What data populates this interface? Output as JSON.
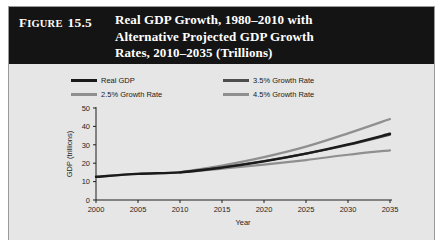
{
  "figure": {
    "tag_word": "Figure",
    "tag_number": "15.5",
    "title_lines": [
      "Real GDP Growth, 1980–2010 with",
      "Alternative Projected GDP Growth",
      "Rates, 2010–2035 (Trillions)"
    ],
    "header_bg": "#141414",
    "card_bg": "#e6e6e6"
  },
  "chart_data": {
    "type": "line",
    "title": "Real GDP Growth, 1980–2010 with Alternative Projected GDP Growth Rates, 2010–2035 (Trillions)",
    "xlabel": "Year",
    "ylabel": "GDP (trillions)",
    "xlim": [
      2000,
      2035
    ],
    "ylim": [
      0,
      50
    ],
    "xticks": [
      "2000",
      "2005",
      "2010",
      "2015",
      "2020",
      "2025",
      "2030",
      "2035"
    ],
    "yticks": [
      "0",
      "10",
      "20",
      "30",
      "40",
      "50"
    ],
    "grid": false,
    "legend_position": "top",
    "x": [
      2000,
      2005,
      2010,
      2015,
      2020,
      2025,
      2030,
      2035
    ],
    "series": [
      {
        "name": "Real GDP",
        "color": "#1a1a1a",
        "width": 2.4,
        "values": [
          12.6,
          14.2,
          15.0,
          17.6,
          21.0,
          25.2,
          30.2,
          36.0
        ]
      },
      {
        "name": "3.5% Growth Rate",
        "color": "#4d4d4d",
        "width": 2.2,
        "values": [
          null,
          null,
          15.0,
          17.8,
          21.2,
          25.2,
          29.9,
          35.5
        ]
      },
      {
        "name": "2.5% Growth Rate",
        "color": "#8f8f8f",
        "width": 2.2,
        "values": [
          12.6,
          14.2,
          15.0,
          17.0,
          19.2,
          21.7,
          24.6,
          27.0
        ]
      },
      {
        "name": "4.5% Growth Rate",
        "color": "#8f8f8f",
        "width": 2.2,
        "values": [
          null,
          null,
          15.0,
          18.7,
          23.3,
          29.0,
          36.2,
          44.0
        ]
      }
    ],
    "legend": [
      {
        "label": "Real GDP",
        "color": "#1a1a1a"
      },
      {
        "label": "3.5% Growth Rate",
        "color": "#4d4d4d"
      },
      {
        "label": "2.5% Growth Rate",
        "color": "#8f8f8f"
      },
      {
        "label": "4.5% Growth Rate",
        "color": "#8f8f8f"
      }
    ]
  }
}
